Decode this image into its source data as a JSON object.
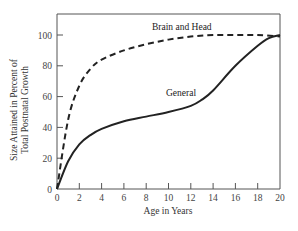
{
  "chart_data": {
    "type": "line",
    "title": "",
    "xlabel": "Age in Years",
    "ylabel": [
      "Size Attained in Percent of",
      "Total Postnatal Growth"
    ],
    "xlim": [
      0,
      20
    ],
    "ylim": [
      0,
      110
    ],
    "x_ticks": [
      "0",
      "2",
      "4",
      "6",
      "8",
      "10",
      "12",
      "14",
      "16",
      "18",
      "20"
    ],
    "y_ticks": [
      "0",
      "20",
      "40",
      "60",
      "80",
      "100"
    ],
    "grid": false,
    "legend": "none (inline labels)",
    "series": [
      {
        "name": "Brain and Head",
        "style": "dashed",
        "x": [
          0,
          1,
          2,
          3,
          4,
          6,
          8,
          10,
          12,
          14,
          16,
          18,
          20
        ],
        "y": [
          0,
          45,
          67,
          78,
          84,
          90,
          94,
          97,
          99,
          100,
          100,
          100,
          99
        ]
      },
      {
        "name": "General",
        "style": "solid",
        "x": [
          0,
          1,
          2,
          3,
          4,
          6,
          8,
          10,
          12,
          13,
          14,
          16,
          18,
          19,
          20
        ],
        "y": [
          0,
          18,
          29,
          35,
          39,
          44,
          47,
          50,
          54,
          58,
          64,
          80,
          93,
          98,
          100
        ]
      }
    ],
    "annotations": [
      {
        "text": "Brain and Head",
        "near": "top of dashed curve"
      },
      {
        "text": "General",
        "near": "solid curve around age 14"
      }
    ]
  }
}
